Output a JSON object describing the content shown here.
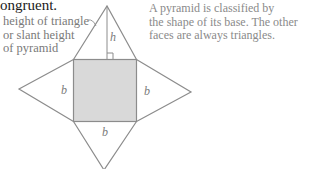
{
  "heading": {
    "text": "ongruent."
  },
  "slant_label": {
    "lines": [
      "height of triangle",
      "or slant height",
      "of pyramid"
    ]
  },
  "note": {
    "lines": [
      "A pyramid is classified by",
      "the shape of its base. The other",
      "faces are always triangles."
    ]
  },
  "figure": {
    "type": "square pyramid net",
    "base_fill": "#d9d9d9",
    "stroke_color": "#8c8c8c",
    "labels": {
      "top_height": "h",
      "left_face": "b",
      "right_face": "b",
      "bottom_face": "b"
    }
  }
}
